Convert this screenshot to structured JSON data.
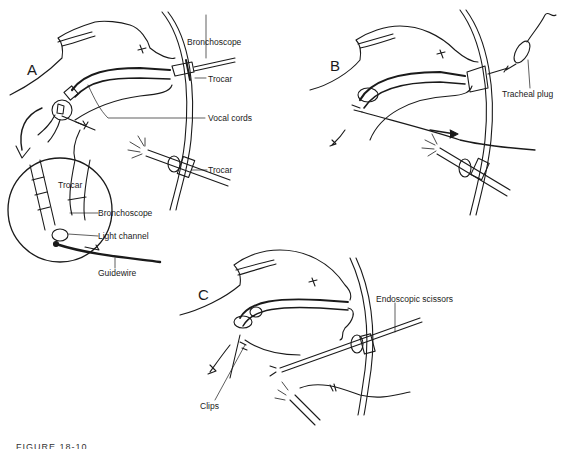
{
  "figure": {
    "panels": [
      {
        "letter": "A",
        "labels": {
          "bronchoscope": "Bronchoscope",
          "trocar_top": "Trocar",
          "vocal_cords": "Vocal cords",
          "trocar_bottom": "Trocar",
          "inset_trocar": "Trocar",
          "inset_bronchoscope": "Bronchoscope",
          "inset_light_channel": "Light channel",
          "inset_guidewire": "Guidewire"
        }
      },
      {
        "letter": "B",
        "labels": {
          "tracheal_plug": "Tracheal plug"
        }
      },
      {
        "letter": "C",
        "labels": {
          "endoscopic_scissors": "Endoscopic scissors",
          "clips": "Clips"
        }
      }
    ],
    "caption_partial": "FIGURE 18-10"
  },
  "colors": {
    "ink": "#1a1a1a",
    "background": "#ffffff"
  }
}
